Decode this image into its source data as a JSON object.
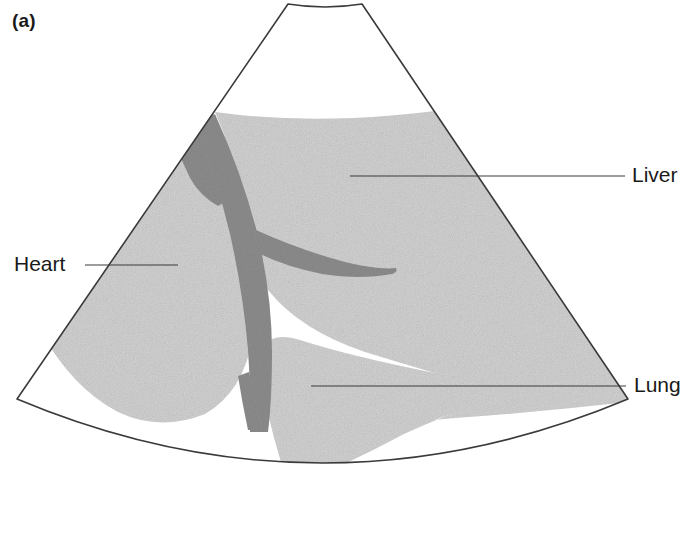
{
  "figure": {
    "panel_label": "(a)",
    "type": "ultrasound-sector-scan-diagram",
    "background_color": "#ffffff",
    "outline_color": "#3a3a3a"
  },
  "annotations": [
    {
      "name": "heart",
      "label": "Heart",
      "side": "left",
      "text_x": 14,
      "text_y": 252,
      "leader_from_x": 85,
      "leader_to_x": 178,
      "leader_y": 265
    },
    {
      "name": "liver",
      "label": "Liver",
      "side": "right",
      "text_x": 632,
      "text_y": 163,
      "leader_from_x": 625,
      "leader_to_x": 350,
      "leader_y": 176
    },
    {
      "name": "lung",
      "label": "Lung",
      "side": "right",
      "text_x": 634,
      "text_y": 373,
      "leader_from_x": 626,
      "leader_to_x": 311,
      "leader_y": 386
    }
  ],
  "scan_sector": {
    "apex_left_x": 288,
    "apex_right_x": 362,
    "apex_y": 4,
    "apex_dip_y": 9,
    "left_corner_x": 17,
    "left_corner_y": 399,
    "right_corner_x": 628,
    "right_corner_y": 399,
    "bottom_arc_center_y": 527,
    "stroke_width": 1.6
  },
  "tissue_regions": [
    {
      "name": "liver-parenchyma",
      "tone": "#d2d2d2",
      "description": "large speckled homogeneous mass filling upper and right sector"
    },
    {
      "name": "heart-chamber",
      "tone": "#d2d2d2",
      "description": "rounded speckled mass at left of sector"
    },
    {
      "name": "lung-wedge",
      "tone": "#d2d2d2",
      "description": "lower speckled wedge tapering to the right"
    },
    {
      "name": "vessel-diaphragm-band",
      "tone": "#8c8c8c",
      "description": "dark curved band running from upper-left down through centre with a tapering right branch"
    }
  ],
  "palette": {
    "tissue_light": "#d2d2d2",
    "tissue_dark": "#8c8c8c",
    "outline": "#3a3a3a",
    "leader_line": "#3a3a3a",
    "text": "#1a1a1a",
    "background": "#ffffff"
  }
}
